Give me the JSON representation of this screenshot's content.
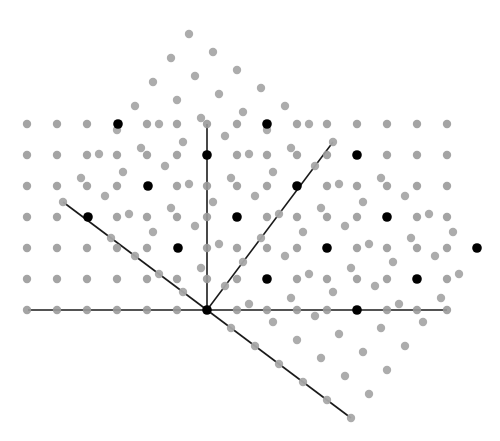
{
  "diagram": {
    "title": "",
    "colors": {
      "background": "#ffffff",
      "lattice_point": "#9a9a9a",
      "coincidence_point": "#000000",
      "line": "#1a1a1a"
    },
    "origin": [
      207,
      310
    ],
    "spacing": 30,
    "square_lattice": {
      "columns": {
        "from": -6,
        "to": 8
      },
      "rows": {
        "from": 0,
        "to": 6
      }
    },
    "rotated_lattice": {
      "basis_a": [
        24,
        18
      ],
      "basis_b": [
        18,
        -24
      ],
      "i_range": [
        -6,
        6
      ],
      "j_range": [
        0,
        7
      ]
    },
    "coincidence_points": [
      [
        207,
        310
      ],
      [
        357,
        310
      ],
      [
        267,
        279
      ],
      [
        417,
        279
      ],
      [
        178,
        248
      ],
      [
        327,
        248
      ],
      [
        477,
        248
      ],
      [
        88,
        217
      ],
      [
        237,
        217
      ],
      [
        387,
        217
      ],
      [
        148,
        186
      ],
      [
        297,
        186
      ],
      [
        207,
        155
      ],
      [
        267,
        124
      ],
      [
        118,
        124
      ],
      [
        357,
        155
      ]
    ],
    "lines": [
      {
        "name": "horizontal-axis-line",
        "from": [
          28,
          310
        ],
        "to": [
          447,
          310
        ]
      },
      {
        "name": "vertical-axis-line",
        "from": [
          207,
          310
        ],
        "to": [
          207,
          124
        ]
      },
      {
        "name": "rotated-axis-line-upper-right",
        "from": [
          207,
          310
        ],
        "to": [
          333,
          142
        ]
      },
      {
        "name": "rotated-axis-line-upper-left",
        "from": [
          207,
          310
        ],
        "to": [
          63,
          202
        ]
      },
      {
        "name": "rotated-axis-line-lower-right",
        "from": [
          207,
          310
        ],
        "to": [
          351,
          418
        ]
      }
    ],
    "point_radius": 4.2
  }
}
